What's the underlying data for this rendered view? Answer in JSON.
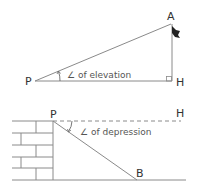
{
  "diagram_elevation": {
    "point_observer": "P",
    "point_top": "A",
    "point_foot": "H",
    "angle_label": "∠ of elevation"
  },
  "diagram_depression": {
    "point_observer": "P",
    "point_horizontal": "H",
    "point_target": "B",
    "angle_label": "∠ of depression"
  },
  "colors": {
    "line": "#8a8a8a",
    "text": "#333333",
    "flag": "#222222"
  }
}
